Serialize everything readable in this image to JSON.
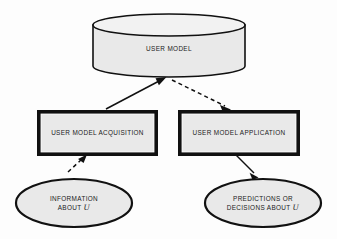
{
  "diagram": {
    "background_color": "#fdfdfd",
    "shape_fill_color": "#e9e9e9",
    "stroke_color": "#111111",
    "nodes": {
      "user_model": {
        "label": "USER MODEL",
        "shape": "cylinder"
      },
      "acquisition": {
        "label": "USER MODEL ACQUISITION",
        "shape": "rectangle"
      },
      "application": {
        "label": "USER MODEL APPLICATION",
        "shape": "rectangle"
      },
      "information": {
        "label_line1": "INFORMATION",
        "label_line2_prefix": "ABOUT ",
        "label_line2_symbol": "U",
        "shape": "ellipse"
      },
      "predictions": {
        "label_line1": "PREDICTIONS OR",
        "label_line2_prefix": "DECISIONS ABOUT ",
        "label_line2_symbol": "U",
        "shape": "ellipse"
      }
    },
    "edges": [
      {
        "id": "acquisition-to-user-model",
        "from": "acquisition",
        "to": "user_model",
        "style": "solid",
        "arrow": "to"
      },
      {
        "id": "user-model-to-application",
        "from": "user_model",
        "to": "application",
        "style": "dashed",
        "arrow": "to"
      },
      {
        "id": "information-to-acquisition",
        "from": "information",
        "to": "acquisition",
        "style": "dashed",
        "arrow": "to"
      },
      {
        "id": "application-to-predictions",
        "from": "application",
        "to": "predictions",
        "style": "solid",
        "arrow": "to"
      }
    ]
  }
}
